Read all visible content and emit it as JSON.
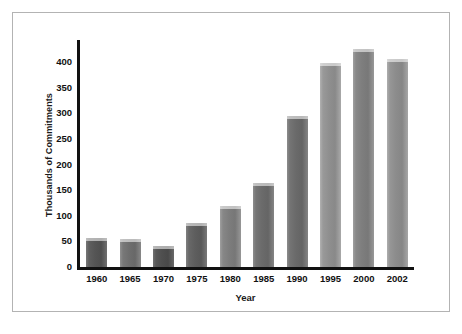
{
  "chart_data": {
    "type": "bar",
    "title": "",
    "xlabel": "Year",
    "ylabel": "Thousands of Commitments",
    "categories": [
      "1960",
      "1965",
      "1970",
      "1975",
      "1980",
      "1985",
      "1990",
      "1995",
      "2000",
      "2002"
    ],
    "values": [
      57,
      55,
      41,
      85,
      120,
      163,
      295,
      398,
      425,
      405
    ],
    "ylim": [
      0,
      440
    ],
    "yticks": [
      0,
      50,
      100,
      150,
      200,
      250,
      300,
      350,
      400
    ],
    "ytick_labels": [
      "0",
      "50",
      "100",
      "150",
      "200",
      "250",
      "300",
      "350",
      "400"
    ],
    "grid": false,
    "legend": "none",
    "bar_colors": [
      "#555555",
      "#6e6e6e",
      "#4f4f4f",
      "#5e5e5e",
      "#7d7d7d",
      "#6b6b6b",
      "#6a6a6a",
      "#8f8f8f",
      "#7e7e7e",
      "#8c8c8c"
    ]
  },
  "figure": {
    "background_color": "#ffffff",
    "frame_color": "#b3b3b3",
    "axis_color": "#111111"
  }
}
